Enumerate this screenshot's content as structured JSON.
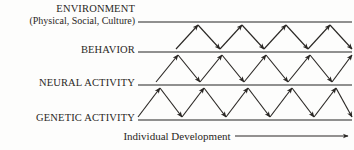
{
  "figure": {
    "background_color": "#fdfdfc",
    "line_color": "#6b6b6b",
    "arrow_color": "#2a2724",
    "text_color": "#2a2724",
    "levels": [
      {
        "id": "environment",
        "label": "ENVIRONMENT",
        "sublabel": "(Physical, Social, Culture)",
        "line_y": 22
      },
      {
        "id": "behavior",
        "label": "BEHAVIOR",
        "sublabel": "",
        "line_y": 52
      },
      {
        "id": "neural",
        "label": "NEURAL ACTIVITY",
        "sublabel": "",
        "line_y": 85
      },
      {
        "id": "genetic",
        "label": "GENETIC ACTIVITY",
        "sublabel": "",
        "line_y": 120
      }
    ],
    "axis": {
      "caption": "Individual Development",
      "left_arrow": "arrow-left",
      "right_arrow": "arrow-right",
      "y": 136,
      "x_start": 138,
      "x_end": 348
    },
    "bands": [
      {
        "id": "environment-behavior",
        "top_line_y": 22,
        "bottom_line_y": 52,
        "x_start": 176,
        "period": 44,
        "cycles": 4
      },
      {
        "id": "behavior-neural",
        "top_line_y": 52,
        "bottom_line_y": 85,
        "x_start": 156,
        "period": 44,
        "cycles": 5
      },
      {
        "id": "neural-genetic",
        "top_line_y": 85,
        "bottom_line_y": 120,
        "x_start": 138,
        "period": 44,
        "cycles": 5
      }
    ]
  }
}
